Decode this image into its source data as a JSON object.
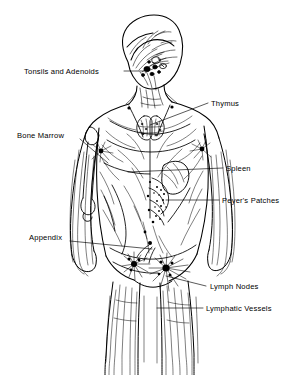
{
  "figure": {
    "background_color": "#ffffff",
    "ink_color": "#000000",
    "view": "anterior three-quarter view of human body, line art"
  },
  "labels": [
    {
      "id": "tonsils-and-adenoids",
      "text": "Tonsils and Adenoids",
      "side": "left",
      "x": 24,
      "y": 68,
      "leader": {
        "x1": 124,
        "y1": 71,
        "x2": 146,
        "y2": 71
      }
    },
    {
      "id": "thymus",
      "text": "Thymus",
      "side": "right",
      "x": 211,
      "y": 100,
      "leader": {
        "x1": 208,
        "y1": 103,
        "x2": 150,
        "y2": 125
      }
    },
    {
      "id": "bone-marrow",
      "text": "Bone Marrow",
      "side": "left",
      "x": 17,
      "y": 132,
      "leader": {
        "x1": 80,
        "y1": 139,
        "x2": 108,
        "y2": 163
      }
    },
    {
      "id": "spleen",
      "text": "Spleen",
      "side": "right",
      "x": 226,
      "y": 165,
      "leader": {
        "x1": 223,
        "y1": 168,
        "x2": 128,
        "y2": 172
      }
    },
    {
      "id": "peyers-patches",
      "text": "Peyer's Patches",
      "side": "right",
      "x": 222,
      "y": 197,
      "leader": {
        "x1": 219,
        "y1": 200,
        "x2": 166,
        "y2": 200
      }
    },
    {
      "id": "appendix",
      "text": "Appendix",
      "side": "left",
      "x": 29,
      "y": 234,
      "leader": {
        "x1": 70,
        "y1": 241,
        "x2": 152,
        "y2": 249
      }
    },
    {
      "id": "lymph-nodes",
      "text": "Lymph Nodes",
      "side": "right",
      "x": 210,
      "y": 283,
      "leader": {
        "x1": 206,
        "y1": 286,
        "x2": 166,
        "y2": 276
      }
    },
    {
      "id": "lymphatic-vessels",
      "text": "Lymphatic Vessels",
      "side": "right",
      "x": 206,
      "y": 305,
      "leader": {
        "x1": 203,
        "y1": 308,
        "x2": 157,
        "y2": 308
      }
    }
  ],
  "structures": [
    {
      "id": "tonsils-and-adenoids",
      "kind": "node-cluster",
      "note": "dark nodules at jaw and upper neck"
    },
    {
      "id": "thymus",
      "kind": "organ",
      "note": "bilobed butterfly organ in upper chest"
    },
    {
      "id": "bone-marrow",
      "kind": "bone",
      "note": "humerus shown inside right arm of figure"
    },
    {
      "id": "spleen",
      "kind": "organ",
      "note": "kidney-bean organ in left upper abdomen"
    },
    {
      "id": "peyers-patches",
      "kind": "stippled-patch",
      "note": "dotted patches on intestine"
    },
    {
      "id": "appendix",
      "kind": "organ",
      "note": "small process at lower right abdomen"
    },
    {
      "id": "lymph-nodes",
      "kind": "node-cluster",
      "note": "radiating starburst clusters at groin, axilla, neck"
    },
    {
      "id": "lymphatic-vessels",
      "kind": "vessel-network",
      "note": "fine branching lines throughout limbs and trunk"
    }
  ]
}
